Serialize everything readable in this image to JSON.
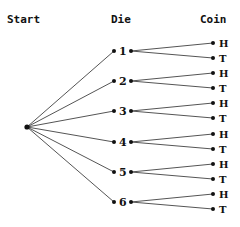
{
  "headers": {
    "start": "Start",
    "die": "Die",
    "coin": "Coin"
  },
  "colors": {
    "line": "#555555",
    "dot": "#111111",
    "text": "#111111",
    "background": "#ffffff"
  },
  "root": {
    "x": 27,
    "y": 127
  },
  "die_outcomes": [
    {
      "label": "1",
      "y": 51
    },
    {
      "label": "2",
      "y": 81
    },
    {
      "label": "3",
      "y": 111
    },
    {
      "label": "4",
      "y": 142
    },
    {
      "label": "5",
      "y": 172
    },
    {
      "label": "6",
      "y": 202
    }
  ],
  "coin_outcomes": [
    "H",
    "T"
  ]
}
